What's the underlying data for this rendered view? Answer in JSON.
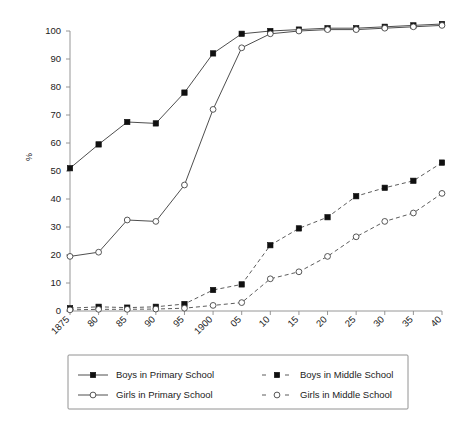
{
  "chart_data": {
    "type": "line",
    "title": "",
    "subtitle": "",
    "xlabel": "",
    "ylabel": "%",
    "ylim": [
      0,
      100
    ],
    "yticks": [
      0,
      10,
      20,
      30,
      40,
      50,
      60,
      70,
      80,
      90,
      100
    ],
    "grid": false,
    "legend_position": "bottom",
    "categories": [
      "1875",
      "80",
      "85",
      "90",
      "95",
      "1900",
      "05",
      "10",
      "15",
      "20",
      "25",
      "30",
      "35",
      "40"
    ],
    "series": [
      {
        "name": "Boys in Primary School",
        "marker": "filled-square",
        "linestyle": "solid",
        "values": [
          51,
          59.5,
          67.5,
          67,
          78,
          92,
          99,
          100,
          100.5,
          101,
          101,
          101.5,
          102,
          102.5
        ]
      },
      {
        "name": "Girls in Primary School",
        "marker": "open-circle",
        "linestyle": "solid",
        "values": [
          19.5,
          21,
          32.5,
          32,
          45,
          72,
          94,
          99,
          100,
          100.5,
          100.5,
          101,
          101.5,
          102
        ]
      },
      {
        "name": "Boys in Middle School",
        "marker": "filled-square",
        "linestyle": "dashed",
        "values": [
          1,
          1.5,
          1.2,
          1.5,
          2.5,
          7.5,
          9.5,
          23.5,
          29.5,
          33.5,
          41,
          44,
          46.5,
          53
        ]
      },
      {
        "name": "Girls in Middle School",
        "marker": "open-circle",
        "linestyle": "dashed",
        "values": [
          0.4,
          0.6,
          0.6,
          0.7,
          1,
          2,
          3,
          11.5,
          14,
          19.5,
          26.5,
          32,
          35,
          42
        ]
      }
    ]
  },
  "axes": {
    "y_title": "%"
  },
  "legend": {
    "entries": [
      {
        "label": "Boys in Primary School",
        "marker": "filled-square",
        "linestyle": "solid"
      },
      {
        "label": "Boys in Middle School",
        "marker": "filled-square",
        "linestyle": "dashed"
      },
      {
        "label": "Girls in Primary School",
        "marker": "open-circle",
        "linestyle": "solid"
      },
      {
        "label": "Girls in Middle School",
        "marker": "open-circle",
        "linestyle": "dashed"
      }
    ]
  }
}
